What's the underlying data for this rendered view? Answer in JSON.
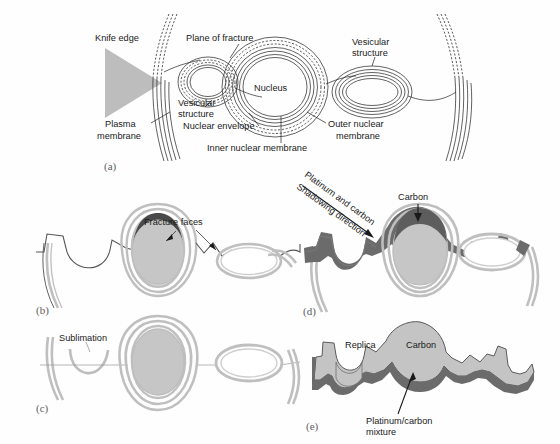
{
  "figure": {
    "background_color": "#fefefe"
  },
  "colors": {
    "nucleus_fill": "#c9c9c9",
    "cytoplasm_fill": "#d6d6d6",
    "membrane_grey": "#bfbfbf",
    "membrane_light": "#e2e2e2",
    "shadow_dark": "#6b6b6b",
    "fracture_face_dark": "#4a4a4a",
    "replica_fill": "#c4c4c4",
    "knife_fill": "#bdbdbd",
    "ink": "#1a1a1a",
    "panel_tag": "#5d5d5d"
  },
  "panels": [
    {
      "id": "a",
      "tag": "(a)",
      "labels": [
        {
          "name": "knife-edge",
          "text": "Knife edge",
          "x": 95,
          "y": 38
        },
        {
          "name": "plane-of-fracture",
          "text": "Plane of fracture",
          "x": 185,
          "y": 38
        },
        {
          "name": "vesicular-structure-left",
          "text": "Vesicular",
          "x": 178,
          "y": 102
        },
        {
          "name": "vesicular-structure-left-2",
          "text": "structure",
          "x": 178,
          "y": 113
        },
        {
          "name": "nucleus",
          "text": "Nucleus",
          "x": 265,
          "y": 93
        },
        {
          "name": "vesicular-structure-right",
          "text": "Vesicular",
          "x": 355,
          "y": 42
        },
        {
          "name": "vesicular-structure-right-2",
          "text": "structure",
          "x": 355,
          "y": 53
        },
        {
          "name": "plasma-membrane",
          "text": "Plasma",
          "x": 107,
          "y": 124
        },
        {
          "name": "plasma-membrane-2",
          "text": "membrane",
          "x": 100,
          "y": 136
        },
        {
          "name": "nuclear-envelope",
          "text": "Nuclear envelope",
          "x": 185,
          "y": 131
        },
        {
          "name": "outer-nuclear-membrane",
          "text": "Outer nuclear",
          "x": 330,
          "y": 126
        },
        {
          "name": "outer-nuclear-membrane-2",
          "text": "membrane",
          "x": 335,
          "y": 137
        },
        {
          "name": "inner-nuclear-membrane",
          "text": "Inner nuclear membrane",
          "x": 215,
          "y": 148
        }
      ]
    },
    {
      "id": "b",
      "tag": "(b)",
      "labels": [
        {
          "name": "fracture-faces",
          "text": "Fracture faces",
          "x": 145,
          "y": 222
        }
      ]
    },
    {
      "id": "c",
      "tag": "(c)",
      "labels": [
        {
          "name": "sublimation",
          "text": "Sublimation",
          "x": 60,
          "y": 338
        }
      ]
    },
    {
      "id": "d",
      "tag": "(d)",
      "labels": [
        {
          "name": "platinum-and-carbon",
          "text": "Platinum and carbon",
          "x": 0,
          "y": 0,
          "rotated": true
        },
        {
          "name": "shadowing-direction",
          "text": "Shadowing direction",
          "x": 0,
          "y": 0,
          "rotated": true
        },
        {
          "name": "carbon-d",
          "text": "Carbon",
          "x": 400,
          "y": 197
        }
      ]
    },
    {
      "id": "e",
      "tag": "(e)",
      "labels": [
        {
          "name": "replica",
          "text": "Replica",
          "x": 348,
          "y": 345
        },
        {
          "name": "carbon-e",
          "text": "Carbon",
          "x": 412,
          "y": 345
        },
        {
          "name": "platinum-carbon-mixture",
          "text": "Platinum/carbon",
          "x": 388,
          "y": 417
        },
        {
          "name": "platinum-carbon-mixture-2",
          "text": "mixture",
          "x": 388,
          "y": 428
        }
      ]
    }
  ],
  "panel_tags": {
    "a": "(a)",
    "b": "(b)",
    "c": "(c)",
    "d": "(d)",
    "e": "(e)"
  },
  "text": {
    "knife_edge": "Knife edge",
    "plane_of_fracture": "Plane of fracture",
    "vesicular": "Vesicular",
    "structure": "structure",
    "nucleus": "Nucleus",
    "plasma": "Plasma",
    "membrane": "membrane",
    "nuclear_envelope": "Nuclear envelope",
    "outer_nuclear": "Outer nuclear",
    "inner_nuclear_membrane": "Inner nuclear membrane",
    "fracture_faces": "Fracture faces",
    "sublimation": "Sublimation",
    "platinum_and_carbon": "Platinum and carbon",
    "shadowing_direction": "Shadowing direction",
    "carbon": "Carbon",
    "replica": "Replica",
    "platinum_carbon": "Platinum/carbon",
    "mixture": "mixture"
  }
}
